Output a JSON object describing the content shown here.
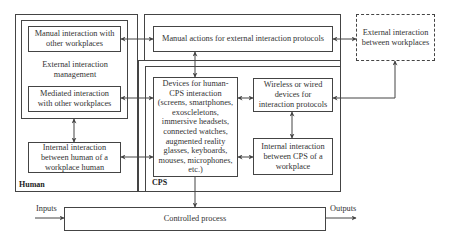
{
  "human_group": {
    "label": "Human",
    "external_management": {
      "label": "External interaction management",
      "manual_interaction": "Manual interaction with other workplaces",
      "mediated_interaction": "Mediated interaction with other workplaces"
    },
    "internal_interaction": "Internal interaction between human of a workplace human"
  },
  "manual_actions": "Manual actions for external interaction protocols",
  "external_interaction": "External interaction between workplaces",
  "cps_group": {
    "label": "CPS",
    "devices": "Devices for human-CPS interaction (screens, smartphones, exoscleletons, immersive headsets, connected watches, augmented reality glasses, keyboards, mouses, microphones, etc.)",
    "wireless_devices": "Wireless or wired devices for interaction protocols",
    "internal_interaction": "Internal interaction between CPS of a workplace"
  },
  "controlled_process": "Controlled process",
  "io": {
    "inputs": "Inputs",
    "outputs": "Outputs"
  },
  "colors": {
    "stroke": "#444444",
    "background": "#ffffff",
    "text": "#333333"
  }
}
